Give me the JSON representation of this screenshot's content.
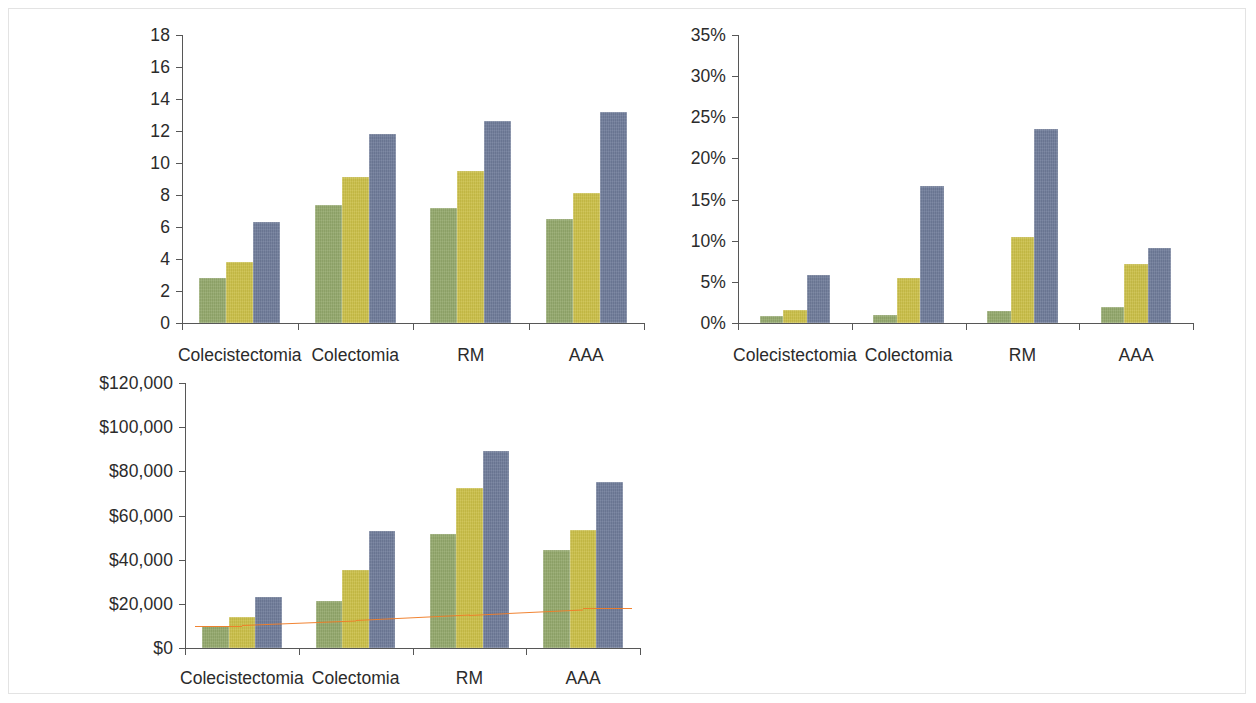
{
  "page": {
    "background": "#ffffff",
    "border_color": "#e3e3e3"
  },
  "palette": {
    "series_1": "#93a86b",
    "series_2": "#cbbf47",
    "series_3": "#6e7b99",
    "axis": "#575757",
    "text": "#2b2b2b",
    "trendline": "#f07d28"
  },
  "series_names": [
    "serie-1",
    "serie-2",
    "serie-3"
  ],
  "charts": [
    {
      "id": "chart-top-left",
      "name": "estancia-media-chart",
      "chart_data": {
        "type": "bar",
        "title": "",
        "subtitle": "",
        "xlabel": "",
        "ylabel": "",
        "categories": [
          "Colecistectomia",
          "Colectomia",
          "RM",
          "AAA"
        ],
        "series": [
          {
            "name": "serie-1",
            "color": "#93a86b",
            "values": [
              2.8,
              7.4,
              7.2,
              6.5
            ]
          },
          {
            "name": "serie-2",
            "color": "#cbbf47",
            "values": [
              3.8,
              9.1,
              9.5,
              8.1
            ]
          },
          {
            "name": "serie-3",
            "color": "#6e7b99",
            "values": [
              6.3,
              11.8,
              12.6,
              13.2
            ]
          }
        ],
        "ylim": [
          0,
          18
        ],
        "yticks": [
          0,
          2,
          4,
          6,
          8,
          10,
          12,
          14,
          16,
          18
        ],
        "ytick_labels": [
          "0",
          "2",
          "4",
          "6",
          "8",
          "10",
          "12",
          "14",
          "16",
          "18"
        ],
        "grid": false,
        "legend": "none"
      }
    },
    {
      "id": "chart-top-right",
      "name": "mortalidad-porcentaje-chart",
      "chart_data": {
        "type": "bar",
        "title": "",
        "subtitle": "",
        "xlabel": "",
        "ylabel": "",
        "categories": [
          "Colecistectomia",
          "Colectomia",
          "RM",
          "AAA"
        ],
        "series": [
          {
            "name": "serie-1",
            "color": "#93a86b",
            "values": [
              0.8,
              1.0,
              1.4,
              2.0
            ]
          },
          {
            "name": "serie-2",
            "color": "#cbbf47",
            "values": [
              1.6,
              5.5,
              10.4,
              7.2
            ]
          },
          {
            "name": "serie-3",
            "color": "#6e7b99",
            "values": [
              5.8,
              16.7,
              23.6,
              9.1
            ]
          }
        ],
        "ylim": [
          0,
          35
        ],
        "yticks": [
          0,
          5,
          10,
          15,
          20,
          25,
          30,
          35
        ],
        "ytick_labels": [
          "0%",
          "5%",
          "10%",
          "15%",
          "20%",
          "25%",
          "30%",
          "35%"
        ],
        "grid": false,
        "legend": "none"
      }
    },
    {
      "id": "chart-bottom-left",
      "name": "coste-chart",
      "chart_data": {
        "type": "bar",
        "title": "",
        "subtitle": "",
        "xlabel": "",
        "ylabel": "",
        "categories": [
          "Colecistectomia",
          "Colectomia",
          "RM",
          "AAA"
        ],
        "series": [
          {
            "name": "serie-1",
            "color": "#93a86b",
            "values": [
              10000,
              21500,
              51500,
              44500
            ]
          },
          {
            "name": "serie-2",
            "color": "#cbbf47",
            "values": [
              14000,
              35500,
              72500,
              53500
            ]
          },
          {
            "name": "serie-3",
            "color": "#6e7b99",
            "values": [
              23000,
              53000,
              89000,
              75000
            ]
          }
        ],
        "trendline": {
          "name": "linea-tendencia",
          "color": "#f07d28",
          "values": [
            10500,
            12500,
            15000,
            17500
          ]
        },
        "ylim": [
          0,
          120000
        ],
        "yticks": [
          0,
          20000,
          40000,
          60000,
          80000,
          100000,
          120000
        ],
        "ytick_labels": [
          "$0",
          "$20,000",
          "$40,000",
          "$60,000",
          "$80,000",
          "$100,000",
          "$120,000"
        ],
        "grid": false,
        "legend": "none"
      }
    }
  ]
}
